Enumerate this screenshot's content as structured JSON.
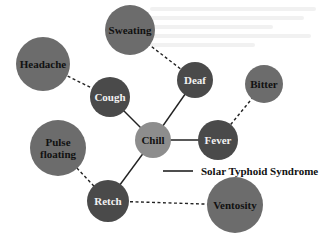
{
  "diagram": {
    "colors": {
      "dark": "#4a4a4a",
      "medium": "#6c6c6c",
      "light": "#8d8d8d",
      "edge": "#222222",
      "text_light": "#f2f2f2",
      "text_dark": "#111111"
    },
    "nodes": [
      {
        "id": "sweating",
        "label": "Sweating",
        "lines": [
          "Sweating"
        ],
        "cx": 130,
        "cy": 30,
        "r": 25,
        "tone": "medium"
      },
      {
        "id": "headache",
        "label": "Headache",
        "lines": [
          "Headache"
        ],
        "cx": 43,
        "cy": 64,
        "r": 27,
        "tone": "medium"
      },
      {
        "id": "cough",
        "label": "Cough",
        "lines": [
          "Cough"
        ],
        "cx": 110,
        "cy": 97,
        "r": 20,
        "tone": "dark"
      },
      {
        "id": "deaf",
        "label": "Deaf",
        "lines": [
          "Deaf"
        ],
        "cx": 195,
        "cy": 80,
        "r": 18,
        "tone": "dark"
      },
      {
        "id": "bitter",
        "label": "Bitter",
        "lines": [
          "Bitter"
        ],
        "cx": 264,
        "cy": 84,
        "r": 19,
        "tone": "medium"
      },
      {
        "id": "chill",
        "label": "Chill",
        "lines": [
          "Chill"
        ],
        "cx": 153,
        "cy": 140,
        "r": 18,
        "tone": "light"
      },
      {
        "id": "fever",
        "label": "Fever",
        "lines": [
          "Fever"
        ],
        "cx": 218,
        "cy": 140,
        "r": 20,
        "tone": "dark"
      },
      {
        "id": "pulse-floating",
        "label": "Pulse floating",
        "lines": [
          "Pulse",
          "floating"
        ],
        "cx": 58,
        "cy": 148,
        "r": 28,
        "tone": "medium"
      },
      {
        "id": "retch",
        "label": "Retch",
        "lines": [
          "Retch"
        ],
        "cx": 108,
        "cy": 201,
        "r": 21,
        "tone": "dark"
      },
      {
        "id": "ventosity",
        "label": "Ventosity",
        "lines": [
          "Ventosity"
        ],
        "cx": 235,
        "cy": 205,
        "r": 28,
        "tone": "medium"
      }
    ],
    "edges": [
      {
        "from": "cough",
        "to": "chill",
        "style": "solid"
      },
      {
        "from": "deaf",
        "to": "chill",
        "style": "solid"
      },
      {
        "from": "chill",
        "to": "fever",
        "style": "solid"
      },
      {
        "from": "chill",
        "to": "retch",
        "style": "solid"
      },
      {
        "from": "headache",
        "to": "cough",
        "style": "dashed"
      },
      {
        "from": "sweating",
        "to": "deaf",
        "style": "dashed"
      },
      {
        "from": "bitter",
        "to": "fever",
        "style": "dashed"
      },
      {
        "from": "pulse-floating",
        "to": "retch",
        "style": "dashed"
      },
      {
        "from": "retch",
        "to": "ventosity",
        "style": "dashed"
      }
    ],
    "legend": {
      "items": [
        {
          "line_style": "solid",
          "label": "Solar Typhoid Syndrome"
        }
      ]
    }
  }
}
